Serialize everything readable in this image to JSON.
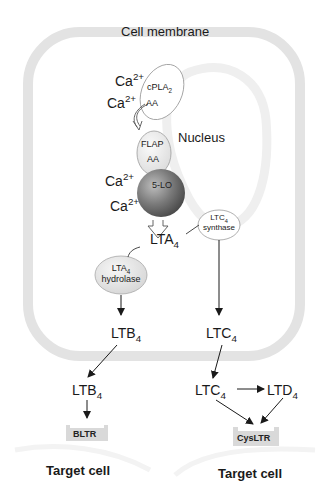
{
  "cell": {
    "membrane_label": "Cell membrane",
    "nucleus_label": "Nucleus"
  },
  "ions": {
    "ca_1": {
      "base": "Ca",
      "sup": "2+"
    },
    "ca_2": {
      "base": "Ca",
      "sup": "2+"
    },
    "ca_3": {
      "base": "Ca",
      "sup": "2+"
    },
    "ca_4": {
      "base": "Ca",
      "sup": "2+"
    }
  },
  "enzymes": {
    "cpla2": {
      "base": "cPLA",
      "sub": "2",
      "substrate": "AA"
    },
    "flap": {
      "name": "FLAP",
      "substrate": "AA"
    },
    "five_lo": {
      "name": "5-LO"
    },
    "ltc4_synthase": {
      "base": "LTC",
      "sub": "4",
      "line2": "synthase"
    },
    "lta4_hydrolase": {
      "base": "LTA",
      "sub": "4",
      "line2": "hydrolase"
    }
  },
  "metabolites": {
    "lta4": {
      "base": "LTA",
      "sub": "4"
    },
    "ltb4_inside": {
      "base": "LTB",
      "sub": "4"
    },
    "ltc4_inside": {
      "base": "LTC",
      "sub": "4"
    },
    "ltb4_outside": {
      "base": "LTB",
      "sub": "4"
    },
    "ltc4_outside": {
      "base": "LTC",
      "sub": "4"
    },
    "ltd4_outside": {
      "base": "LTD",
      "sub": "4"
    }
  },
  "receptors": {
    "bltr": "BLTR",
    "cysltr": "CysLTR"
  },
  "targets": {
    "left": "Target cell",
    "right": "Target cell"
  },
  "colors": {
    "membrane": "#e3e3e3",
    "nucleus_membrane": "#efefef",
    "enzyme_fill": "#f2f2f2",
    "five_lo_dark": "#5a5a5a",
    "receptor_fill": "#d9d9d9",
    "text": "#1a1a1a"
  }
}
